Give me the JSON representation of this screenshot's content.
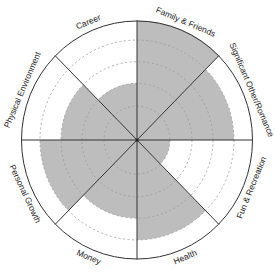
{
  "chart_data": {
    "type": "radial-bar",
    "title": "",
    "scale": {
      "min": 0,
      "max": 5,
      "ring_levels": [
        1,
        2,
        3,
        4
      ]
    },
    "categories": [
      "Family & Friends",
      "Significant Other/Romance",
      "Fun & Recreation",
      "Health",
      "Money",
      "Personal Growth",
      "Physical Environment",
      "Career"
    ],
    "values": [
      5,
      4,
      1,
      4,
      3,
      4,
      3,
      2
    ],
    "grid": "dashed concentric rings",
    "legend": "none"
  },
  "style": {
    "fill_color": "#bdbdbd",
    "line_color": "#333333",
    "ring_color": "#9a9a9a"
  },
  "labels": {
    "s0": "Family & Friends",
    "s1": "Significant Other/Romance",
    "s2": "Fun & Recreation",
    "s3": "Health",
    "s4": "Money",
    "s5": "Personal Growth",
    "s6": "Physical Environment",
    "s7": "Career"
  }
}
